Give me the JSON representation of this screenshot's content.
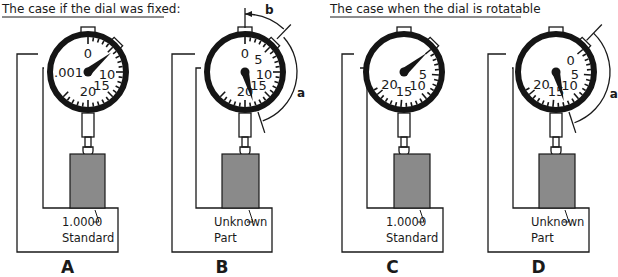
{
  "headings": {
    "fixed": "The case if the dial was fixed:",
    "rotatable": "The case when the dial is rotatable"
  },
  "panels": [
    {
      "id": "A",
      "letter": "A",
      "cx": 88,
      "frame_left": 17,
      "inner_left": 43,
      "block_left": 70,
      "block_right": 105,
      "base_right": 118,
      "dial_rotation_deg": 0,
      "needle_angle_deg": 50,
      "dial_labels": [
        {
          "text": "0",
          "angle": 0
        },
        {
          "text": "10",
          "angle": 95
        },
        {
          "text": "15",
          "angle": 135
        },
        {
          "text": "20",
          "angle": 180
        }
      ],
      "unit_label": ".001",
      "part_label_line1": "1.0000",
      "part_label_line2": "Standard",
      "annotations": []
    },
    {
      "id": "B",
      "letter": "B",
      "cx": 245,
      "frame_left": 172,
      "inner_left": 196,
      "block_left": 222,
      "block_right": 259,
      "base_right": 272,
      "dial_rotation_deg": 0,
      "needle_angle_deg": 165,
      "dial_labels": [
        {
          "text": "0",
          "angle": 0
        },
        {
          "text": "5",
          "angle": 45
        },
        {
          "text": "10",
          "angle": 95
        },
        {
          "text": "15",
          "angle": 135
        },
        {
          "text": "20",
          "angle": 180
        }
      ],
      "unit_label": "",
      "part_label_line1": "Unknown",
      "part_label_line2": "Part",
      "annotations": [
        {
          "text": "b",
          "kind": "offset"
        },
        {
          "text": "a",
          "kind": "reading"
        }
      ]
    },
    {
      "id": "C",
      "letter": "C",
      "cx": 404,
      "frame_left": 342,
      "inner_left": 367,
      "block_left": 394,
      "block_right": 430,
      "base_right": 443,
      "dial_rotation_deg": 50,
      "needle_angle_deg": 50,
      "dial_labels": [
        {
          "text": "5",
          "angle": 95
        },
        {
          "text": "10",
          "angle": 135
        },
        {
          "text": "15",
          "angle": 180
        },
        {
          "text": "20",
          "angle": 230
        }
      ],
      "unit_label": "",
      "part_label_line1": "1.0000",
      "part_label_line2": "Standard",
      "annotations": []
    },
    {
      "id": "D",
      "letter": "D",
      "cx": 556,
      "frame_left": 488,
      "inner_left": 513,
      "block_left": 539,
      "block_right": 575,
      "base_right": 589,
      "dial_rotation_deg": 50,
      "needle_angle_deg": 165,
      "dial_labels": [
        {
          "text": "0",
          "angle": 50
        },
        {
          "text": "5",
          "angle": 95
        },
        {
          "text": "10",
          "angle": 135
        },
        {
          "text": "15",
          "angle": 180
        },
        {
          "text": "20",
          "angle": 230
        }
      ],
      "unit_label": "",
      "part_label_line1": "Unknown",
      "part_label_line2": "Part",
      "annotations": [
        {
          "text": "a",
          "kind": "reading"
        }
      ]
    }
  ],
  "colors": {
    "ink": "#1a1a1a",
    "block_fill": "#8a8a8a",
    "background": "#ffffff"
  }
}
